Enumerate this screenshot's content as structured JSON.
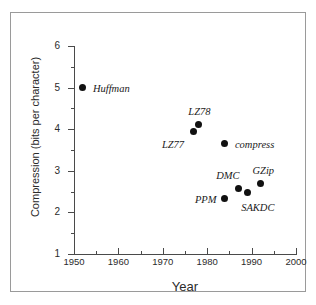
{
  "chart_data": {
    "type": "scatter",
    "title": "",
    "xlabel": "Year",
    "ylabel": "Compression (bits per character)",
    "xlim": [
      1950,
      2000
    ],
    "ylim": [
      1,
      6
    ],
    "grid": false,
    "legend": "none",
    "x_ticks_major": [
      1950,
      1960,
      1970,
      1980,
      1990,
      2000
    ],
    "x_tick_labels": [
      "1950",
      "1960",
      "1970",
      "1980",
      "1990",
      "2000"
    ],
    "x_ticks_minor": [
      1955,
      1965,
      1975,
      1985,
      1995
    ],
    "y_ticks_major": [
      1,
      2,
      3,
      4,
      5,
      6
    ],
    "y_tick_labels": [
      "1",
      "2",
      "3",
      "4",
      "5",
      "6"
    ],
    "y_ticks_minor": [
      1.5,
      2.5,
      3.5,
      4.5,
      5.5
    ],
    "points": [
      {
        "label": "Huffman",
        "x": 1952,
        "y": 5.0,
        "label_dx": 10,
        "label_dy": -4
      },
      {
        "label": "LZ77",
        "x": 1977,
        "y": 3.95,
        "label_dx": -32,
        "label_dy": 9
      },
      {
        "label": "LZ78",
        "x": 1978,
        "y": 4.12,
        "label_dx": -10,
        "label_dy": -17
      },
      {
        "label": "compress",
        "x": 1984,
        "y": 3.65,
        "label_dx": 10,
        "label_dy": -4
      },
      {
        "label": "PPM",
        "x": 1984,
        "y": 2.33,
        "label_dx": -30,
        "label_dy": -4
      },
      {
        "label": "DMC",
        "x": 1987,
        "y": 2.58,
        "label_dx": -22,
        "label_dy": -17
      },
      {
        "label": "SAKDC",
        "x": 1989,
        "y": 2.47,
        "label_dx": -6,
        "label_dy": 10
      },
      {
        "label": "GZip",
        "x": 1992,
        "y": 2.7,
        "label_dx": -8,
        "label_dy": -17
      }
    ]
  },
  "colors": {
    "point": "#111111",
    "axis": "#4a4a4a",
    "frame": "#9a9a9a",
    "text": "#2b2b2b",
    "background": "#ffffff"
  }
}
